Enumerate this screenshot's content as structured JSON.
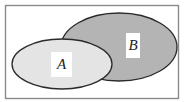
{
  "diagram": {
    "type": "venn",
    "sets": [
      {
        "id": "A",
        "label": "A",
        "fill": "#e4e4e4"
      },
      {
        "id": "B",
        "label": "B",
        "fill": "#b4b4b4"
      }
    ],
    "colors": {
      "stroke": "#2a2a2a",
      "border": "#777777",
      "background": "#ffffff"
    }
  }
}
